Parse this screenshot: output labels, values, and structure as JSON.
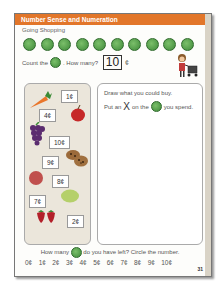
{
  "header": {
    "title": "Number Sense and Numeration",
    "color": "#e2762a"
  },
  "subtitle": "Going Shopping",
  "coins": {
    "count": 10,
    "label": "coin-icon",
    "color": "#4f9a45"
  },
  "count_prompt": {
    "before": "Count the",
    "after": ". How many?",
    "answer": "10",
    "unit": "¢"
  },
  "items": [
    {
      "name": "carrot",
      "price": "1¢"
    },
    {
      "name": "apple",
      "price": "4¢"
    },
    {
      "name": "grapes",
      "price": "10¢"
    },
    {
      "name": "cookies",
      "price": "9¢"
    },
    {
      "name": "plum",
      "price": "8¢"
    },
    {
      "name": "lemon",
      "price": "7¢"
    },
    {
      "name": "strawberries",
      "price": "2¢"
    }
  ],
  "draw_panel": {
    "line1": "Draw what you could buy.",
    "line2_a": "Put an",
    "line2_x": "X",
    "line2_b": "on the",
    "line2_c": "you spend."
  },
  "bottom_question": {
    "before": "How many",
    "after": "do you have left? Circle the number."
  },
  "choices": [
    "0¢",
    "1¢",
    "2¢",
    "3¢",
    "4¢",
    "5¢",
    "6¢",
    "7¢",
    "8¢",
    "9¢",
    "10¢"
  ],
  "page_number": "31"
}
